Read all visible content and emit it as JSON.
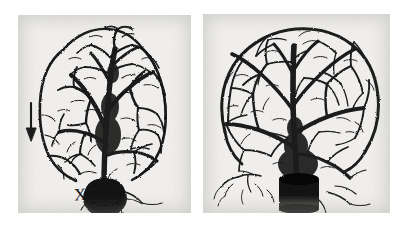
{
  "figure": {
    "background_color": "#ffffff",
    "panel_background_color": "#f1f0ee",
    "ink_color": "#111111",
    "panel_count": 2
  },
  "panels": [
    {
      "id": "panel-left",
      "label": "left-panel",
      "description": "Dense, compacted vascular tree with coarse thick trunks converging on a dark basal mass",
      "markers": [
        {
          "name": "arrow-marker",
          "glyph": "arrow-down",
          "label": "",
          "target": "marginal vessel along left border"
        },
        {
          "name": "x-marker",
          "glyph": "X",
          "label": "X",
          "target": "dark basal cannula mass"
        }
      ]
    },
    {
      "id": "panel-right",
      "label": "right-panel",
      "description": "Open arcaded vascular tree with fine arborized branches and wide avascular interstices, converging on a dark basal cylinder",
      "markers": []
    }
  ],
  "markers": {
    "x_label": "X",
    "arrow_label": ""
  }
}
